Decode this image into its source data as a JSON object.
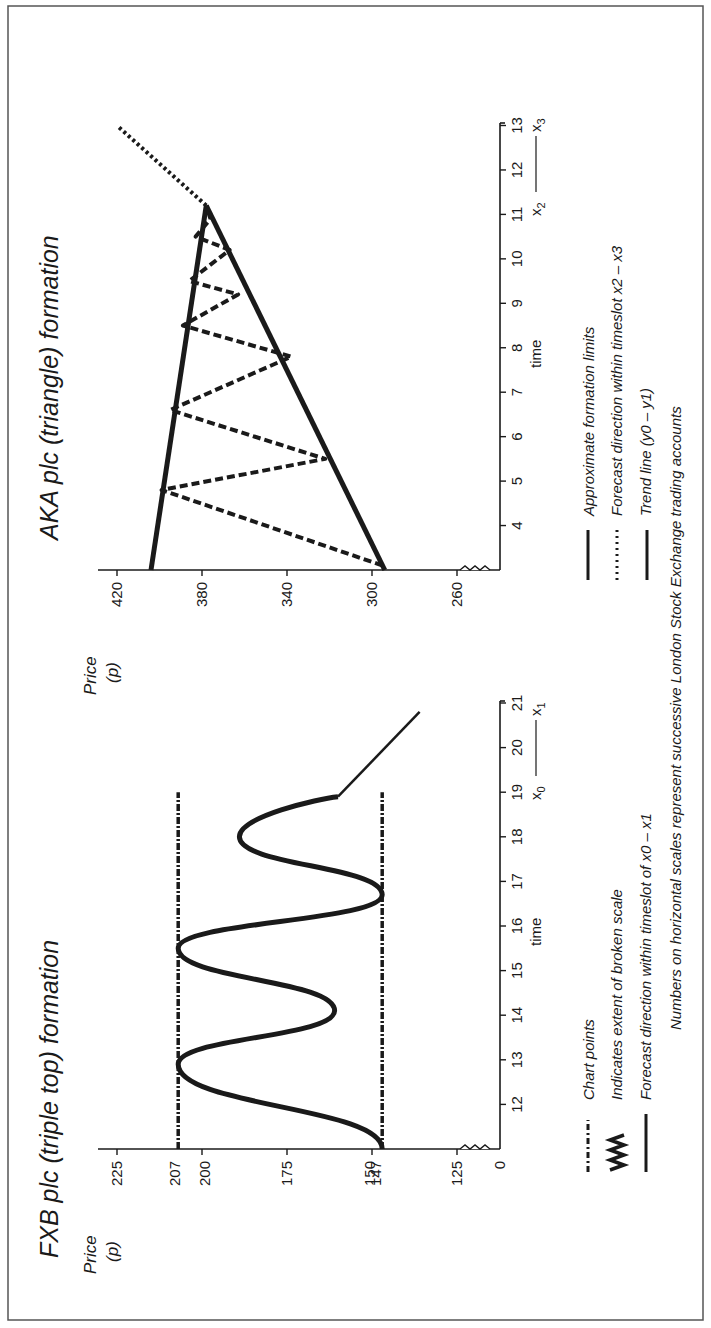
{
  "figure": {
    "orientation": "rotated 90 degrees counter-clockwise",
    "border_color": "#555555",
    "ink_color": "#1a1a1a",
    "footnote": "Numbers on horizontal scales represent successive London Stock Exchange trading accounts"
  },
  "chart_data": [
    {
      "id": "fxb",
      "type": "line",
      "title": "FXB plc (triple top) formation",
      "ylabel": "Price",
      "ylabel_unit": "(p)",
      "xlabel": "time",
      "x_range_label": {
        "start": "x0",
        "end": "x1",
        "start_sub": "0",
        "end_sub": "1"
      },
      "y_ticks": [
        "225",
        "207",
        "200",
        "175",
        "150",
        "147",
        "125",
        "0"
      ],
      "y_tick_values": [
        225,
        207,
        200,
        175,
        150,
        147,
        125,
        0
      ],
      "x_ticks": [
        "12",
        "13",
        "14",
        "15",
        "16",
        "17",
        "18",
        "19",
        "20",
        "21"
      ],
      "x_tick_values": [
        12,
        13,
        14,
        15,
        16,
        17,
        18,
        19,
        20,
        21
      ],
      "xlim": [
        11,
        21
      ],
      "ylim": [
        0,
        230
      ],
      "broken_scale": true,
      "series": [
        {
          "name": "Forecast direction within timeslot of x0 - x1",
          "style": "solid-thick-curve",
          "points": [
            [
              11,
              147
            ],
            [
              12.9,
              207
            ],
            [
              14.1,
              161
            ],
            [
              15.5,
              207
            ],
            [
              16.7,
              147
            ],
            [
              18.0,
              189
            ],
            [
              18.9,
              160
            ]
          ]
        },
        {
          "name": "Forecast continuation",
          "style": "solid-thin",
          "points": [
            [
              18.9,
              160
            ],
            [
              20.8,
              136
            ]
          ]
        },
        {
          "name": "Chart points (upper limit)",
          "style": "dash-dot",
          "points": [
            [
              11,
              207
            ],
            [
              19,
              207
            ]
          ]
        },
        {
          "name": "Chart points (lower limit)",
          "style": "dash-dot",
          "points": [
            [
              11,
              147
            ],
            [
              19,
              147
            ]
          ]
        }
      ],
      "legend": [
        {
          "symbol": "dash-dot",
          "label": "Chart points"
        },
        {
          "symbol": "zigzag",
          "label": "Indicates extent of broken scale"
        },
        {
          "symbol": "solid",
          "label": "Forecast direction within timeslot of x0 – x1"
        }
      ]
    },
    {
      "id": "aka",
      "type": "line",
      "title": "AKA plc (triangle) formation",
      "ylabel": "Price",
      "ylabel_unit": "(p)",
      "xlabel": "time",
      "x_range_label": {
        "start": "x2",
        "end": "x3",
        "start_sub": "2",
        "end_sub": "3"
      },
      "y_ticks": [
        "420",
        "380",
        "340",
        "300",
        "260"
      ],
      "y_tick_values": [
        420,
        380,
        340,
        300,
        260
      ],
      "x_ticks": [
        "4",
        "5",
        "6",
        "7",
        "8",
        "9",
        "10",
        "11",
        "12",
        "13"
      ],
      "x_tick_values": [
        4,
        5,
        6,
        7,
        8,
        9,
        10,
        11,
        12,
        13
      ],
      "xlim": [
        3,
        13
      ],
      "ylim": [
        245,
        430
      ],
      "broken_scale": true,
      "series": [
        {
          "name": "Approximate formation limits (upper)",
          "style": "solid-thick",
          "points": [
            [
              3,
              404
            ],
            [
              11.2,
              378
            ]
          ]
        },
        {
          "name": "Trend line (y0 - y1)",
          "style": "solid-thick",
          "points": [
            [
              3,
              294
            ],
            [
              11.2,
              378
            ]
          ]
        },
        {
          "name": "Forecast direction within timeslot x2 - x3",
          "style": "dotted",
          "points": [
            [
              11.2,
              378
            ],
            [
              13.0,
              420
            ]
          ]
        },
        {
          "name": "Price swings",
          "style": "dashed",
          "points": [
            [
              3.1,
              295
            ],
            [
              4.8,
              399
            ],
            [
              5.5,
              322
            ],
            [
              6.6,
              395
            ],
            [
              7.8,
              338
            ],
            [
              8.5,
              389
            ],
            [
              9.2,
              363
            ],
            [
              9.5,
              386
            ],
            [
              10.2,
              367
            ],
            [
              10.5,
              383
            ],
            [
              10.9,
              376
            ],
            [
              11.2,
              378
            ]
          ]
        }
      ],
      "legend": [
        {
          "symbol": "solid",
          "label": "Approximate formation limits"
        },
        {
          "symbol": "dotted",
          "label": "Forecast direction within timeslot x2 – x3"
        },
        {
          "symbol": "solid",
          "label": "Trend line (y0 – y1)"
        }
      ]
    }
  ]
}
